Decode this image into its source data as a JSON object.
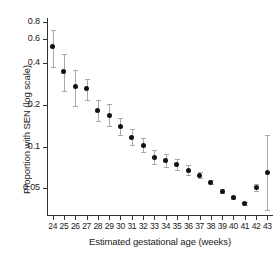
{
  "chart_data": {
    "type": "scatter",
    "title": "",
    "xlabel": "Estimated gestational age (weeks)",
    "ylabel": "Proportion with SEN (log scale)",
    "yscale": "log",
    "ylim": [
      0.032,
      0.85
    ],
    "grid": false,
    "legend": false,
    "ytick_labels": [
      "0.8",
      "0.6",
      "0.4",
      "0.2",
      "0.1",
      "0.05"
    ],
    "ytick_values": [
      0.8,
      0.6,
      0.4,
      0.2,
      0.1,
      0.05
    ],
    "categories": [
      24,
      25,
      26,
      27,
      28,
      29,
      30,
      31,
      32,
      33,
      34,
      35,
      36,
      37,
      38,
      39,
      40,
      41,
      42,
      43
    ],
    "xtick_labels": [
      "24",
      "25",
      "26",
      "27",
      "28",
      "29",
      "30",
      "31",
      "32",
      "33",
      "34",
      "35",
      "36",
      "37",
      "38",
      "39",
      "40",
      "41",
      "42",
      "43"
    ],
    "series": [
      {
        "name": "Proportion with SEN",
        "marker": "filled-circle",
        "marker_color": "#111111",
        "errorbar_color": "#a8a8a8",
        "values": [
          0.525,
          0.35,
          0.272,
          0.262,
          0.182,
          0.168,
          0.14,
          0.117,
          0.102,
          0.084,
          0.079,
          0.074,
          0.067,
          0.062,
          0.055,
          0.047,
          0.043,
          0.039,
          0.051,
          0.065
        ],
        "ci_low": [
          0.375,
          0.253,
          0.196,
          0.216,
          0.152,
          0.14,
          0.121,
          0.103,
          0.091,
          0.075,
          0.071,
          0.068,
          0.062,
          0.059,
          0.054,
          0.046,
          0.042,
          0.038,
          0.048,
          0.035
        ],
        "ci_high": [
          0.7,
          0.47,
          0.36,
          0.31,
          0.216,
          0.203,
          0.162,
          0.134,
          0.116,
          0.095,
          0.088,
          0.081,
          0.073,
          0.066,
          0.057,
          0.049,
          0.044,
          0.04,
          0.054,
          0.122
        ]
      }
    ]
  }
}
